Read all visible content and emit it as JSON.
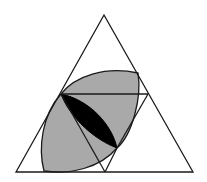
{
  "diagram": {
    "colors": {
      "background": "#ffffff",
      "stroke": "#1a1a1a",
      "gray_fill": "#a9a9a9",
      "black_fill": "#000000"
    },
    "outer_triangle": {
      "apex": [
        104,
        15
      ],
      "bottom_left": [
        16,
        172
      ],
      "bottom_right": [
        193,
        172
      ]
    },
    "inner_points": {
      "P_left": [
        61,
        94
      ],
      "R_right": [
        148,
        94
      ],
      "Q_lower": [
        117,
        148
      ],
      "B_bottom": [
        105,
        172
      ]
    }
  }
}
